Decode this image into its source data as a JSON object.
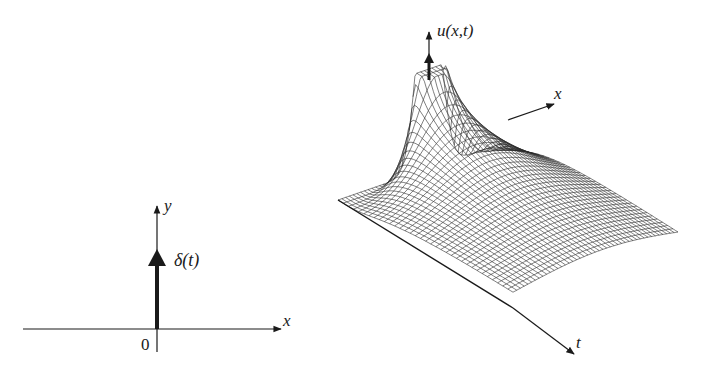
{
  "left_diagram": {
    "title": "Delta function impulse",
    "x_axis_label": "x",
    "y_axis_label": "y",
    "origin_label": "0",
    "impulse_label": "δ(t)"
  },
  "right_diagram": {
    "title": "Heat kernel surface u(x,t)",
    "vertical_axis_label": "u(x,t)",
    "x_axis_label": "x",
    "t_axis_label": "t",
    "mesh": {
      "x_lines": 44,
      "t_lines": 34
    }
  },
  "colors": {
    "ink": "#1a1a1a",
    "mesh": "#2a2a2a",
    "background": "#ffffff"
  }
}
